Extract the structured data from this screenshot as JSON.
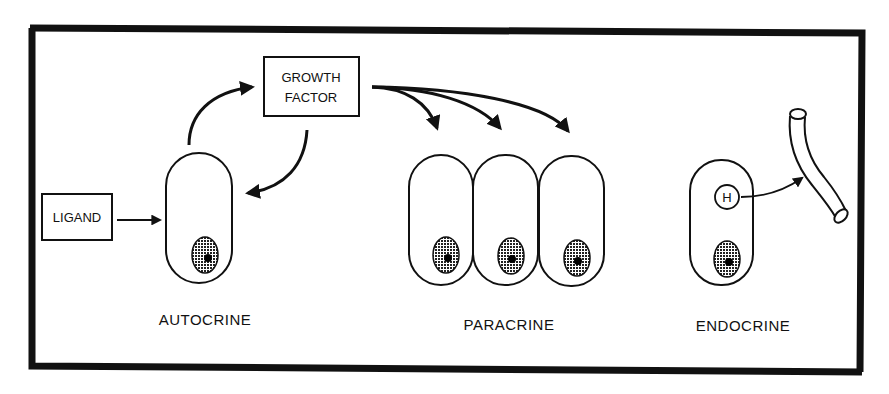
{
  "diagram": {
    "boxes": {
      "growth_factor": {
        "line1": "GROWTH",
        "line2": "FACTOR"
      },
      "ligand": {
        "label": "LIGAND"
      }
    },
    "hormone_marker": "H",
    "captions": {
      "autocrine": "AUTOCRINE",
      "paracrine": "PARACRINE",
      "endocrine": "ENDOCRINE"
    },
    "panels": [
      {
        "name": "autocrine",
        "cells": 1,
        "signal_source": "growth factor",
        "input": "ligand"
      },
      {
        "name": "paracrine",
        "cells": 3,
        "signal_source": "growth factor"
      },
      {
        "name": "endocrine",
        "cells": 1,
        "signal_source": "hormone",
        "target": "blood vessel"
      }
    ],
    "colors": {
      "ink": "#111111",
      "background": "#ffffff"
    }
  }
}
